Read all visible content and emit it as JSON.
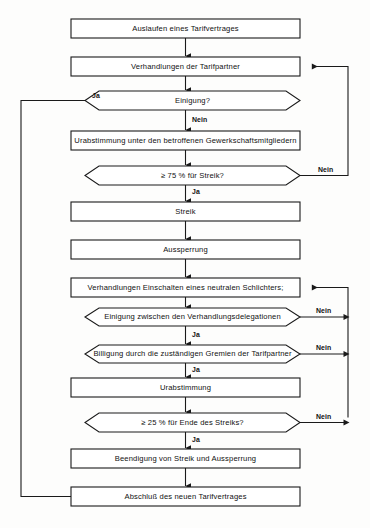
{
  "diagram": {
    "language": "de",
    "background_color": "#fdfdfc",
    "line_color": "#1a1a1a",
    "node_fill": "#ffffff"
  },
  "nodes": [
    {
      "id": "n1",
      "type": "process",
      "label": "Auslaufen eines Tarifvertrages",
      "x": 71,
      "y": 19,
      "w": 229,
      "h": 19
    },
    {
      "id": "n2",
      "type": "process",
      "label": "Verhandlungen der Tarifpartner",
      "x": 71,
      "y": 57,
      "w": 229,
      "h": 19
    },
    {
      "id": "n3",
      "type": "decision",
      "label": "Einigung?",
      "x": 85,
      "y": 91,
      "w": 215,
      "h": 19
    },
    {
      "id": "n4",
      "type": "process",
      "label": "Urabstimmung unter den betroffenen Gewerkschaftsmitgliedern",
      "x": 71,
      "y": 131,
      "w": 229,
      "h": 19
    },
    {
      "id": "n5",
      "type": "decision",
      "label": "≥ 75 % für Streik?",
      "x": 85,
      "y": 166,
      "w": 215,
      "h": 19
    },
    {
      "id": "n6",
      "type": "process",
      "label": "Streik",
      "x": 71,
      "y": 202,
      "w": 229,
      "h": 19
    },
    {
      "id": "n7",
      "type": "process",
      "label": "Aussperrung",
      "x": 71,
      "y": 240,
      "w": 229,
      "h": 19
    },
    {
      "id": "n8",
      "type": "process",
      "label": "Verhandlungen  Einschalten eines neutralen Schlichters;",
      "x": 71,
      "y": 278,
      "w": 229,
      "h": 19
    },
    {
      "id": "n9",
      "type": "decision",
      "label": "Einigung zwischen den Verhandlungsdelegationen",
      "x": 85,
      "y": 308,
      "w": 215,
      "h": 18
    },
    {
      "id": "n10",
      "type": "decision",
      "label": "Billigung durch die zuständigen Gremien der Tarifpartner",
      "x": 85,
      "y": 345,
      "w": 215,
      "h": 18
    },
    {
      "id": "n11",
      "type": "process",
      "label": "Urabstimmung",
      "x": 71,
      "y": 378,
      "w": 229,
      "h": 19
    },
    {
      "id": "n12",
      "type": "decision",
      "label": "≥ 25 % für Ende des Streiks?",
      "x": 85,
      "y": 413,
      "w": 215,
      "h": 19
    },
    {
      "id": "n13",
      "type": "process",
      "label": "Beendigung von Streik und Aussperrung",
      "x": 71,
      "y": 449,
      "w": 229,
      "h": 19
    },
    {
      "id": "n14",
      "type": "process",
      "label": "Abschluß des neuen Tarifvertrages",
      "x": 71,
      "y": 487,
      "w": 229,
      "h": 19
    }
  ],
  "edge_labels": [
    {
      "id": "e_ja_einigung",
      "text": "Ja",
      "x": 96,
      "y": 96,
      "align": "center"
    },
    {
      "id": "e_nein_einigung",
      "text": "Nein",
      "x": 192,
      "y": 120,
      "align": "start"
    },
    {
      "id": "e_nein_75",
      "text": "Nein",
      "x": 318,
      "y": 170,
      "align": "start"
    },
    {
      "id": "e_ja_75",
      "text": "Ja",
      "x": 192,
      "y": 192,
      "align": "start"
    },
    {
      "id": "e_nein_einigung2",
      "text": "Nein",
      "x": 316,
      "y": 312,
      "align": "start"
    },
    {
      "id": "e_ja_einigung2",
      "text": "Ja",
      "x": 192,
      "y": 335,
      "align": "start"
    },
    {
      "id": "e_nein_billigung",
      "text": "Nein",
      "x": 316,
      "y": 349,
      "align": "start"
    },
    {
      "id": "e_ja_billigung",
      "text": "Ja",
      "x": 192,
      "y": 370,
      "align": "start"
    },
    {
      "id": "e_nein_25",
      "text": "Nein",
      "x": 316,
      "y": 418,
      "align": "start"
    },
    {
      "id": "e_ja_25",
      "text": "Ja",
      "x": 192,
      "y": 440,
      "align": "start"
    }
  ],
  "connectors": [
    {
      "id": "c1",
      "from": "n1",
      "to": "n2",
      "kind": "down-arrow"
    },
    {
      "id": "c2",
      "from": "n2",
      "to": "n3",
      "kind": "down-arrow"
    },
    {
      "id": "c3",
      "from": "n3",
      "to": "n4",
      "kind": "down-arrow-nein"
    },
    {
      "id": "c4",
      "from": "n4",
      "to": "n5",
      "kind": "down-arrow"
    },
    {
      "id": "c5",
      "from": "n5",
      "to": "n6",
      "kind": "down-arrow-ja"
    },
    {
      "id": "c6",
      "from": "n6",
      "to": "n7",
      "kind": "down-arrow"
    },
    {
      "id": "c7",
      "from": "n7",
      "to": "n8",
      "kind": "down-arrow"
    },
    {
      "id": "c8",
      "from": "n8",
      "to": "n9",
      "kind": "down-arrow"
    },
    {
      "id": "c9",
      "from": "n9",
      "to": "n10",
      "kind": "down-arrow-ja"
    },
    {
      "id": "c10",
      "from": "n10",
      "to": "n11",
      "kind": "down-arrow-ja"
    },
    {
      "id": "c11",
      "from": "n11",
      "to": "n12",
      "kind": "down-arrow"
    },
    {
      "id": "c12",
      "from": "n12",
      "to": "n13",
      "kind": "down-arrow-ja"
    },
    {
      "id": "c13",
      "from": "n13",
      "to": "n14",
      "kind": "down-arrow"
    },
    {
      "id": "c14",
      "from": "n3",
      "to": "n14",
      "kind": "left-loop-ja"
    },
    {
      "id": "c15",
      "from": "n5",
      "to": "n2",
      "kind": "right-loop-nein"
    },
    {
      "id": "c16",
      "from": "n9",
      "to": "n8",
      "kind": "right-loop-nein"
    },
    {
      "id": "c17",
      "from": "n10",
      "to": "n8",
      "kind": "right-loop-nein"
    },
    {
      "id": "c18",
      "from": "n12",
      "to": "n8",
      "kind": "right-loop-nein"
    }
  ]
}
